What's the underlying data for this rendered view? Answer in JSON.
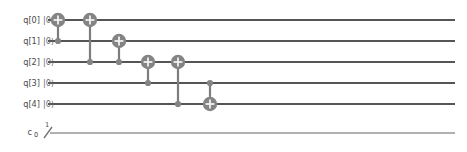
{
  "diagram": {
    "kind": "quantum-circuit",
    "renderer_style": "qiskit-matplotlib",
    "background_color": "#ffffff",
    "wire_color": "#555555",
    "clbit_wire_color": "#b0b0b0",
    "gate_color": "#848484",
    "gate_symbol_color": "#f2f2f2"
  },
  "quantum_registers": [
    {
      "label": "q[0]",
      "initial_state": "|0⟩",
      "wire_y": 20
    },
    {
      "label": "q[1]",
      "initial_state": "|0⟩",
      "wire_y": 41
    },
    {
      "label": "q[2]",
      "initial_state": "|0⟩",
      "wire_y": 62
    },
    {
      "label": "q[3]",
      "initial_state": "|0⟩",
      "wire_y": 83
    },
    {
      "label": "q[4]",
      "initial_state": "|0⟩",
      "wire_y": 104
    }
  ],
  "classical_register": {
    "label": "c",
    "index": "0",
    "width": "1",
    "slash": "/",
    "wire_y": 133
  },
  "wire_geometry": {
    "x_start": 48,
    "x_end": 455,
    "clbit_x_start": 50
  },
  "gates": [
    {
      "name": "cx",
      "label": "CNOT",
      "x": 58,
      "control_qubit": 1,
      "target_qubit": 0
    },
    {
      "name": "cx",
      "label": "CNOT",
      "x": 90,
      "control_qubit": 2,
      "target_qubit": 0
    },
    {
      "name": "cx",
      "label": "CNOT",
      "x": 119,
      "control_qubit": 2,
      "target_qubit": 1
    },
    {
      "name": "cx",
      "label": "CNOT",
      "x": 148,
      "control_qubit": 3,
      "target_qubit": 2
    },
    {
      "name": "cx",
      "label": "CNOT",
      "x": 178,
      "control_qubit": 4,
      "target_qubit": 2
    },
    {
      "name": "cx",
      "label": "CNOT",
      "x": 210,
      "control_qubit": 3,
      "target_qubit": 4
    }
  ],
  "chart_data": {
    "type": "table",
    "title": "",
    "categories": [
      "q[0]",
      "q[1]",
      "q[2]",
      "q[3]",
      "q[4]",
      "c"
    ],
    "series": [
      {
        "name": "cx(q1,q0)",
        "values": [
          "target",
          "control",
          "-",
          "-",
          "-",
          "-"
        ]
      },
      {
        "name": "cx(q2,q0)",
        "values": [
          "target",
          "-",
          "control",
          "-",
          "-",
          "-"
        ]
      },
      {
        "name": "cx(q2,q1)",
        "values": [
          "-",
          "target",
          "control",
          "-",
          "-",
          "-"
        ]
      },
      {
        "name": "cx(q3,q2)",
        "values": [
          "-",
          "-",
          "target",
          "control",
          "-",
          "-"
        ]
      },
      {
        "name": "cx(q4,q2)",
        "values": [
          "-",
          "-",
          "target",
          "-",
          "control",
          "-"
        ]
      },
      {
        "name": "cx(q3,q4)",
        "values": [
          "-",
          "-",
          "-",
          "control",
          "target",
          "-"
        ]
      }
    ],
    "xlabel": "circuit depth (columns)",
    "ylabel": "qubit wire"
  }
}
